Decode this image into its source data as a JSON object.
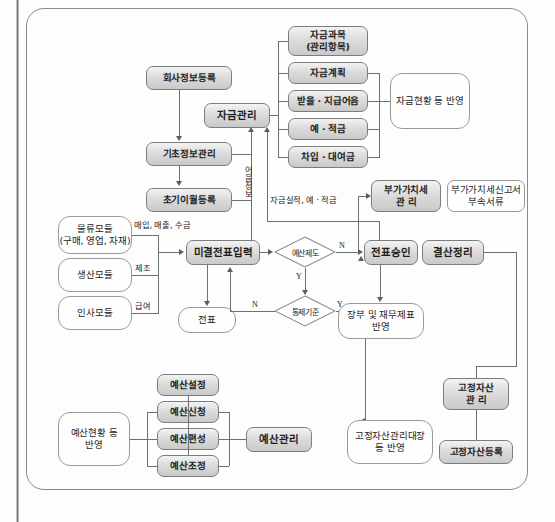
{
  "diagram": {
    "type": "flowchart",
    "frame_style": "rounded-rectangle"
  },
  "nodes": {
    "company_info": "회사정보등록",
    "base_info": "기초정보관리",
    "initial_carryover": "초기이월등록",
    "fund_mgmt": "자금관리",
    "fund_subject": "자금과목\n(관리항목)",
    "fund_plan": "자금계획",
    "notes_receivable_payable": "받을 · 지급어음",
    "deposit_installment": "예 · 적금",
    "borrowing_lending": "차입 · 대여금",
    "fund_status_reflect": "자금현황 등 반영",
    "vat_mgmt": "부가가치세\n관    리",
    "vat_report_attach": "부가가치세신고서\n부속서류",
    "logistics_module": "물류모듈\n(구매, 영업, 자재)",
    "production_module": "생산모듈",
    "hr_module": "인사모듈",
    "unsettled_slip_input": "미결전표입력",
    "slip": "전표",
    "slip_approval": "전표승인",
    "closing_adjustment": "결산정리",
    "books_financial_statements": "장부 및 재무제표\n반영",
    "budget_setting": "예산설정",
    "budget_request": "예산신청",
    "budget_formulation": "예산편성",
    "budget_adjustment": "예산조정",
    "budget_mgmt": "예산관리",
    "budget_status_reflect": "예산현황 등\n반영",
    "fixed_asset_mgmt": "고정자산\n관    리",
    "fixed_asset_register": "고정자산등록",
    "fixed_asset_ledger": "고정자산관리대장\n등 반영"
  },
  "decisions": {
    "budget_system": "예산제도",
    "control_standard": "통제기준"
  },
  "edge_labels": {
    "note_info": "어음정보",
    "fund_result": "자금실적, 예 · 적금",
    "purchase_sales_collection": "매입, 매출, 수금",
    "manufacturing": "제조",
    "payroll": "급여",
    "yes_budget": "Y",
    "no_budget": "N",
    "yes_control": "Y",
    "no_control": "N"
  },
  "colors": {
    "shaded_fill": "#dcdcdc",
    "plain_fill": "#fefefe",
    "border": "#8e8e8e",
    "connector": "#6f6f6f",
    "text": "#1d1d1d",
    "frame": "#8a8a8a"
  }
}
